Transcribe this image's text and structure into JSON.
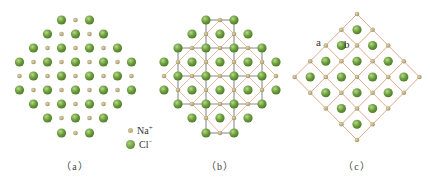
{
  "figure": {
    "panels": [
      {
        "id": "a",
        "caption": "（a）",
        "caption_x": 75,
        "type": "ion-layer",
        "center_x": 75.5
      },
      {
        "id": "b",
        "caption": "（b）",
        "caption_x": 220,
        "type": "ion-layer-with-lattice",
        "center_x": 220
      },
      {
        "id": "c",
        "caption": "（c）",
        "caption_x": 357,
        "type": "diamond-unit-lattice"
      }
    ],
    "legend": {
      "na_label": "Na",
      "na_charge": "+",
      "cl_label": "Cl",
      "cl_charge": "−"
    },
    "annotations": {
      "a": "a",
      "b": "b"
    },
    "layer_rows": [
      {
        "y": 20,
        "pattern": "CNC"
      },
      {
        "y": 34,
        "pattern": "CNCNC"
      },
      {
        "y": 48,
        "pattern": "CNCNCNC"
      },
      {
        "y": 62,
        "pattern": "CNCNCNCNC"
      },
      {
        "y": 76,
        "pattern": "NCNCNCNCN"
      },
      {
        "y": 90,
        "pattern": "CNCNCNCNC"
      },
      {
        "y": 104,
        "pattern": "CNCNCNC"
      },
      {
        "y": 118,
        "pattern": "CNCNC"
      },
      {
        "y": 133,
        "pattern": "CNC"
      }
    ],
    "spacing": 14,
    "colors": {
      "cl": "#6a9a3a",
      "cl_highlight": "#a9d27c",
      "na": "#b3a373",
      "na_highlight": "#dccfa6",
      "gray_line": "#8c8c8c",
      "orange_line": "#e6b79a",
      "orange_line_c": "#e2a888"
    },
    "diamond_c": {
      "top": [
        357,
        14
      ],
      "step_x": 15.6,
      "step_y": 15.75,
      "cells": 4
    }
  }
}
